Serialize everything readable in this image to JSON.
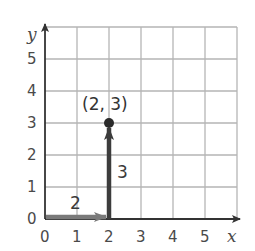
{
  "diagram": {
    "type": "coordinate-grid",
    "x_axis_label": "x",
    "y_axis_label": "y",
    "x_ticks": [
      "0",
      "1",
      "2",
      "3",
      "4",
      "5"
    ],
    "y_ticks": [
      "0",
      "1",
      "2",
      "3",
      "4",
      "5"
    ],
    "point": {
      "label": "(2, 3)",
      "x": 2,
      "y": 3
    },
    "horizontal_move": {
      "label": "2",
      "from": [
        0,
        0
      ],
      "to": [
        2,
        0
      ]
    },
    "vertical_move": {
      "label": "3",
      "from": [
        2,
        0
      ],
      "to": [
        2,
        3
      ]
    },
    "colors": {
      "grid": "#b5b5b5",
      "axis": "#333333",
      "horizontal_arrow": "#7a7a7a",
      "vertical_arrow": "#3c3c3c",
      "point": "#2a2a2a"
    }
  }
}
